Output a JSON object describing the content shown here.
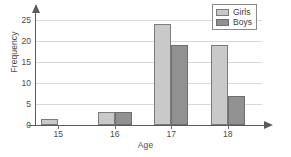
{
  "chart_data": {
    "type": "bar",
    "title": "",
    "xlabel": "Age",
    "ylabel": "Frequency",
    "categories": [
      "15",
      "16",
      "17",
      "18"
    ],
    "series": [
      {
        "name": "Girls",
        "color": "#c9c9c9",
        "values": [
          1.5,
          3,
          24,
          19
        ]
      },
      {
        "name": "Boys",
        "color": "#919191",
        "values": [
          0,
          3,
          19,
          7
        ]
      }
    ],
    "ylim": [
      0,
      25
    ],
    "yticks": [
      0,
      5,
      10,
      15,
      20,
      25
    ],
    "ytick_labels": [
      "0",
      "5",
      "10",
      "15",
      "20",
      "25"
    ],
    "grid": true,
    "grid_axis": "y",
    "legend_position": "top-right",
    "axis_arrows": true
  },
  "legend": {
    "entries": [
      {
        "label": "Girls"
      },
      {
        "label": "Boys"
      }
    ]
  },
  "axes": {
    "y_title": "Frequency",
    "x_title": "Age"
  }
}
